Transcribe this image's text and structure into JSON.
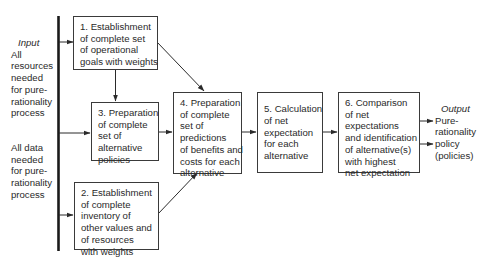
{
  "colors": {
    "line": "#2a2a2a",
    "text": "#2a2a2a",
    "background": "#ffffff"
  },
  "input": {
    "header": "Input",
    "group1": [
      "All",
      "resources",
      "needed",
      "for pure-",
      "rationality",
      "process"
    ],
    "group2": [
      "All data",
      "needed",
      "for pure-",
      "rationality",
      "process"
    ]
  },
  "boxes": [
    {
      "id": "box-1",
      "lines": [
        "1. Establishment",
        "of complete set",
        "of operational",
        "goals with weights"
      ]
    },
    {
      "id": "box-2",
      "lines": [
        "2. Establishment",
        "of complete",
        "inventory of",
        "other values and",
        "of resources",
        "with weights"
      ]
    },
    {
      "id": "box-3",
      "lines": [
        "3. Preparation",
        "of complete",
        "set of",
        "alternative",
        "policies"
      ]
    },
    {
      "id": "box-4",
      "lines": [
        "4. Preparation",
        "of complete",
        "set of",
        "predictions",
        "of benefits and",
        "costs for each",
        "alternative"
      ]
    },
    {
      "id": "box-5",
      "lines": [
        "5. Calculation",
        "of net",
        "expectation",
        "for each",
        "alternative"
      ]
    },
    {
      "id": "box-6",
      "lines": [
        "6. Comparison",
        "of net",
        "expectations",
        "and identification",
        "of alternative(s)",
        "with highest",
        "net expectation"
      ]
    }
  ],
  "output": {
    "header": "Output",
    "lines": [
      "Pure-",
      "rationality",
      "policy",
      "(policies)"
    ]
  },
  "edges": [
    {
      "from": "input-bar",
      "to": "box-1"
    },
    {
      "from": "input-bar",
      "to": "box-3"
    },
    {
      "from": "input-bar",
      "to": "box-2"
    },
    {
      "from": "box-1",
      "to": "box-3"
    },
    {
      "from": "box-1",
      "to": "box-4"
    },
    {
      "from": "box-2",
      "to": "box-4"
    },
    {
      "from": "box-3",
      "to": "box-4"
    },
    {
      "from": "box-4",
      "to": "box-5"
    },
    {
      "from": "box-5",
      "to": "box-6"
    },
    {
      "from": "box-6",
      "to": "output"
    },
    {
      "from": "box-6",
      "to": "output"
    }
  ]
}
